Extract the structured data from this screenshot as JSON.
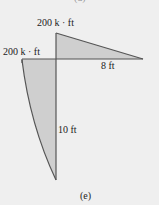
{
  "diagram": {
    "top_caption_partial": "(d)",
    "caption": "(e)",
    "colors": {
      "background": "#efefef",
      "fill": "#cfcfcf",
      "stroke": "#555555"
    },
    "labels": {
      "moment_top": "200 k · ft",
      "moment_left": "200 k · ft",
      "horizontal_length": "8 ft",
      "vertical_length": "10 ft"
    },
    "regions": [
      {
        "name": "beam-triangle",
        "shape": "linear",
        "peak": "200 k · ft",
        "span": "8 ft"
      },
      {
        "name": "column-parabola",
        "shape": "parabolic",
        "peak": "200 k · ft",
        "span": "10 ft"
      }
    ]
  }
}
